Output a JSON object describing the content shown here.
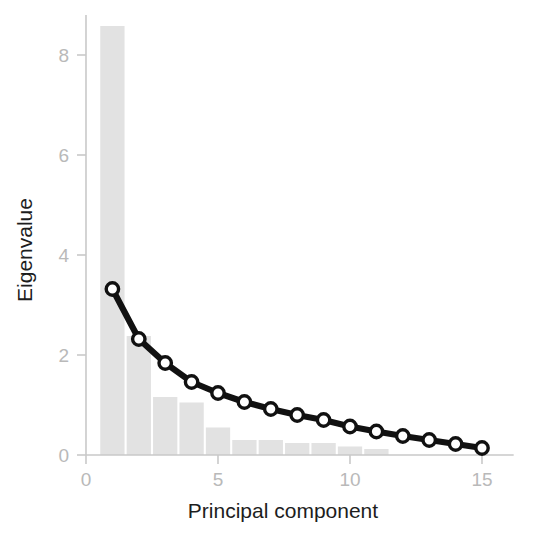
{
  "figure": {
    "name": "scree-plot",
    "background_color": "#ffffff"
  },
  "chart_data": {
    "type": "bar",
    "title": "",
    "subtitle": "",
    "xlabel": "Principal component",
    "ylabel": "Eigenvalue",
    "xlim": [
      0,
      16.2
    ],
    "ylim": [
      0,
      8.8
    ],
    "grid": false,
    "legend": null,
    "x_ticks": [
      0,
      5,
      10,
      15
    ],
    "x_tick_labels": [
      "0",
      "5",
      "10",
      "15"
    ],
    "y_ticks": [
      0,
      2,
      4,
      6,
      8
    ],
    "y_tick_labels": [
      "0",
      "2",
      "4",
      "6",
      "8"
    ],
    "categories": [
      1,
      2,
      3,
      4,
      5,
      6,
      7,
      8,
      9,
      10,
      11,
      12,
      13,
      14,
      15
    ],
    "series": [
      {
        "name": "Eigenvalue bars",
        "type": "bar",
        "color": "#e2e2e2",
        "values": [
          8.58,
          2.38,
          1.16,
          1.05,
          0.55,
          0.3,
          0.3,
          0.24,
          0.24,
          0.17,
          0.12,
          0.0,
          0.0,
          0.0,
          0.0
        ]
      },
      {
        "name": "Eigenvalue line",
        "type": "line",
        "color": "#111111",
        "marker": "circle-open",
        "marker_fill": "#ffffff",
        "values": [
          3.32,
          2.32,
          1.84,
          1.46,
          1.24,
          1.06,
          0.92,
          0.8,
          0.7,
          0.57,
          0.47,
          0.38,
          0.3,
          0.22,
          0.14
        ]
      }
    ],
    "annotations": []
  },
  "labels": {
    "x_axis_title": "Principal component",
    "y_axis_title": "Eigenvalue"
  }
}
